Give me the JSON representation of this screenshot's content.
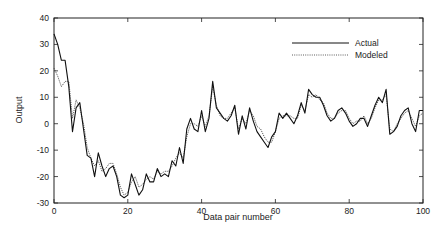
{
  "chart_data": {
    "type": "line",
    "title": "",
    "xlabel": "Data pair number",
    "ylabel": "Output",
    "xlim": [
      0,
      100
    ],
    "ylim": [
      -30,
      40
    ],
    "xticks": [
      0,
      20,
      40,
      60,
      80,
      100
    ],
    "yticks": [
      -30,
      -20,
      -10,
      0,
      10,
      20,
      30,
      40
    ],
    "grid": false,
    "legend_position": "upper right",
    "legend": [
      "Actual",
      "Modeled"
    ],
    "x": [
      0,
      1,
      2,
      3,
      4,
      5,
      6,
      7,
      8,
      9,
      10,
      11,
      12,
      13,
      14,
      15,
      16,
      17,
      18,
      19,
      20,
      21,
      22,
      23,
      24,
      25,
      26,
      27,
      28,
      29,
      30,
      31,
      32,
      33,
      34,
      35,
      36,
      37,
      38,
      39,
      40,
      41,
      42,
      43,
      44,
      45,
      46,
      47,
      48,
      49,
      50,
      51,
      52,
      53,
      54,
      55,
      56,
      57,
      58,
      59,
      60,
      61,
      62,
      63,
      64,
      65,
      66,
      67,
      68,
      69,
      70,
      71,
      72,
      73,
      74,
      75,
      76,
      77,
      78,
      79,
      80,
      81,
      82,
      83,
      84,
      85,
      86,
      87,
      88,
      89,
      90,
      91,
      92,
      93,
      94,
      95,
      96,
      97,
      98,
      99,
      100
    ],
    "series": [
      {
        "name": "Actual",
        "style": "solid",
        "values": [
          34,
          30,
          24,
          24,
          14,
          -3,
          6,
          8,
          -2,
          -12,
          -13,
          -20,
          -11,
          -16,
          -20,
          -17,
          -16,
          -20,
          -27,
          -28,
          -27,
          -19,
          -23,
          -27,
          -25,
          -19,
          -22,
          -22,
          -17,
          -20,
          -19,
          -20,
          -14,
          -16,
          -9,
          -15,
          -2,
          2,
          -2,
          -3,
          5,
          -3,
          2,
          16,
          6,
          4,
          2,
          1,
          3,
          7,
          -4,
          3,
          -2,
          6,
          1,
          -3,
          -5,
          -7,
          -9,
          -5,
          -3,
          4,
          2,
          4,
          2,
          0,
          3,
          8,
          4,
          13,
          11,
          10,
          10,
          7,
          3,
          1,
          2,
          5,
          6,
          4,
          1,
          -1,
          0,
          2,
          2,
          -1,
          3,
          7,
          10,
          8,
          13,
          -4,
          -3,
          -1,
          3,
          5,
          6,
          0,
          -3,
          5,
          5
        ],
        "color": "#111111"
      },
      {
        "name": "Modeled",
        "style": "dotted",
        "values": [
          21,
          18,
          14,
          16,
          16,
          2,
          9,
          6,
          0,
          -9,
          -13,
          -16,
          -14,
          -18,
          -17,
          -15,
          -15,
          -19,
          -24,
          -27,
          -26,
          -22,
          -20,
          -24,
          -23,
          -21,
          -20,
          -21,
          -18,
          -19,
          -18,
          -18,
          -16,
          -13,
          -11,
          -13,
          -5,
          0,
          0,
          -1,
          3,
          -1,
          3,
          14,
          7,
          3,
          2,
          2,
          4,
          6,
          -2,
          2,
          0,
          5,
          3,
          -1,
          -2,
          -5,
          -7,
          -7,
          -3,
          2,
          3,
          3,
          3,
          2,
          2,
          7,
          5,
          11,
          10,
          11,
          9,
          8,
          4,
          2,
          2,
          4,
          5,
          5,
          2,
          0,
          1,
          1,
          3,
          0,
          2,
          6,
          9,
          9,
          11,
          -2,
          -3,
          0,
          2,
          4,
          5,
          2,
          -1,
          3,
          4
        ],
        "color": "#333333"
      }
    ]
  },
  "axes": {
    "y_ticks": [
      "40",
      "30",
      "20",
      "10",
      "0",
      "-10",
      "-20",
      "-30"
    ],
    "x_ticks": [
      "0",
      "20",
      "40",
      "60",
      "80",
      "100"
    ],
    "xlabel": "Data pair number",
    "ylabel": "Output"
  },
  "legend": {
    "actual": "Actual",
    "modeled": "Modeled"
  }
}
